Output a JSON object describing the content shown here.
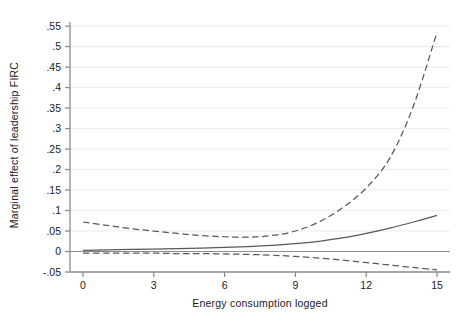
{
  "chart_data": {
    "type": "line",
    "title": "",
    "subtitle": "",
    "xlabel": "Energy consumption logged",
    "ylabel": "Marginal effect of leadership FIRC",
    "xlim": [
      -0.55,
      15.55
    ],
    "ylim": [
      -0.05,
      0.56
    ],
    "xticks": [
      0,
      3,
      6,
      9,
      12,
      15
    ],
    "xtick_labels": [
      "0",
      "3",
      "6",
      "9",
      "12",
      "15"
    ],
    "yticks": [
      -0.05,
      0,
      0.05,
      0.1,
      0.15,
      0.2,
      0.25,
      0.3,
      0.35,
      0.4,
      0.45,
      0.5,
      0.55
    ],
    "ytick_labels": [
      "-.05",
      "0",
      ".05",
      ".1",
      ".15",
      ".2",
      ".25",
      ".3",
      ".35",
      ".4",
      ".45",
      ".5",
      ".55"
    ],
    "grid": true,
    "grid_axis": "y",
    "grid_color": "#ececec",
    "legend": false,
    "legend_position": "none",
    "zero_reference_line": 0,
    "colors": {
      "point_estimate": "#595959",
      "confidence_interval": "#595959",
      "zero_line": "#8c8c8c",
      "axis": "#8c8c8c",
      "grid": "#ececec",
      "background": "#ffffff"
    },
    "x": [
      0,
      1,
      2,
      3,
      4,
      5,
      6,
      7,
      8,
      9,
      10,
      11,
      12,
      13,
      14,
      15
    ],
    "series": [
      {
        "name": "Marginal effect (point estimate)",
        "style": "solid",
        "values": [
          0.003,
          0.004,
          0.005,
          0.006,
          0.007,
          0.008,
          0.01,
          0.012,
          0.015,
          0.019,
          0.025,
          0.033,
          0.044,
          0.057,
          0.072,
          0.088
        ]
      },
      {
        "name": "Upper 95% confidence bound",
        "style": "dashed",
        "values": [
          0.072,
          0.064,
          0.056,
          0.05,
          0.044,
          0.039,
          0.036,
          0.035,
          0.039,
          0.05,
          0.072,
          0.107,
          0.155,
          0.228,
          0.355,
          0.535
        ]
      },
      {
        "name": "Lower 95% confidence bound",
        "style": "dashed",
        "values": [
          -0.004,
          -0.004,
          -0.004,
          -0.004,
          -0.005,
          -0.005,
          -0.006,
          -0.007,
          -0.009,
          -0.012,
          -0.016,
          -0.021,
          -0.027,
          -0.033,
          -0.039,
          -0.045
        ]
      }
    ],
    "annotations": []
  }
}
